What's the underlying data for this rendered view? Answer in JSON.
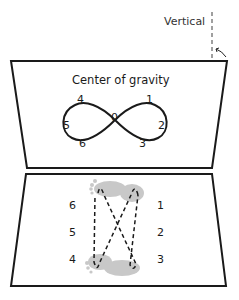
{
  "diagram": {
    "vertical_label": "Vertical",
    "top_panel": {
      "title": "Center of gravity",
      "figure_eight_labels": {
        "center": "0",
        "upper_right": "1",
        "right": "2",
        "lower_right": "3",
        "upper_left": "4",
        "left": "5",
        "lower_left": "6"
      }
    },
    "bottom_panel": {
      "left_labels": [
        "6",
        "5",
        "4"
      ],
      "right_labels": [
        "1",
        "2",
        "3"
      ],
      "footprint_color": "#c8c8c8"
    },
    "colors": {
      "stroke": "#1a1a1a",
      "dashed_vertical": "#888888"
    }
  }
}
